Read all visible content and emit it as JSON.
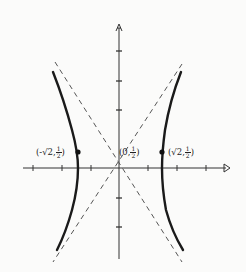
{
  "diagram": {
    "type": "hyperbola-graph",
    "axes": {
      "x_arrow": true,
      "y_arrow": true,
      "x_ticks": [
        -3,
        -2,
        -1,
        1,
        2,
        3
      ],
      "y_ticks": [
        -2,
        -1,
        1,
        2,
        3
      ]
    },
    "center": {
      "label_open": "(0,",
      "label_num": "1",
      "label_den": "2",
      "label_close": ")"
    },
    "vertex_left": {
      "label_open": "(-√2,",
      "label_num": "1",
      "label_den": "2",
      "label_close": ")"
    },
    "vertex_right": {
      "label_open": "(√2,",
      "label_num": "1",
      "label_den": "2",
      "label_close": ")"
    },
    "asymptotes": [
      "dashed line through center, positive slope",
      "dashed line through center, negative slope"
    ],
    "colors": {
      "ink": "#1a1a1a",
      "dash": "#555555",
      "background": "#fbfbfa"
    }
  }
}
